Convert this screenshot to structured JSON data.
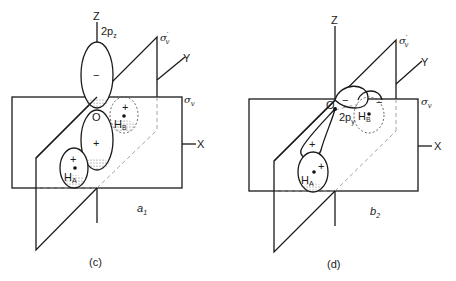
{
  "figure": {
    "panels": [
      {
        "id": "c",
        "caption": "(c)",
        "symmetry_label": "a",
        "symmetry_sub": "1",
        "orbital_label": "2p",
        "orbital_sub": "z",
        "axes": {
          "z": "Z",
          "y": "Y",
          "x": "X"
        },
        "planes": {
          "sigma_v": "σ",
          "sigma_v_sub": "v",
          "sigma_v_prime": "σ",
          "sigma_v_prime_sub": "v",
          "prime": "′"
        },
        "atoms": {
          "center": "O",
          "ha": "H",
          "ha_sub": "A",
          "hb": "H",
          "hb_sub": "B"
        },
        "signs": {
          "upper_lobe": "−",
          "lower_lobe": "+",
          "ha": "+",
          "hb": "+"
        }
      },
      {
        "id": "d",
        "caption": "(d)",
        "symmetry_label": "b",
        "symmetry_sub": "2",
        "orbital_label": "2p",
        "orbital_sub": "y",
        "axes": {
          "z": "Z",
          "y": "Y",
          "x": "X"
        },
        "planes": {
          "sigma_v": "σ",
          "sigma_v_sub": "v",
          "sigma_v_prime": "σ",
          "sigma_v_prime_sub": "v",
          "prime": "′"
        },
        "atoms": {
          "center": "O",
          "ha": "H",
          "ha_sub": "A",
          "hb": "H",
          "hb_sub": "B"
        },
        "signs": {
          "back_lobe": "−",
          "front_lobe": "+",
          "ha": "+",
          "hb": "−",
          "hb_lobe": "−"
        }
      }
    ]
  }
}
